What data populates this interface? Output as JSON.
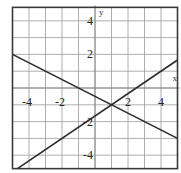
{
  "chart_data": {
    "type": "line",
    "title": "",
    "xlabel": "x",
    "ylabel": "y",
    "xlim": [
      -5,
      5
    ],
    "ylim": [
      -4.8,
      4.8
    ],
    "grid": true,
    "x_ticks": [
      -4,
      -2,
      2,
      4
    ],
    "y_ticks": [
      4,
      2,
      -2,
      -4
    ],
    "x_tick_labels": [
      "-4",
      "-2",
      "2",
      "4"
    ],
    "y_tick_labels": [
      "4",
      "2",
      "-2",
      "-4"
    ],
    "series": [
      {
        "name": "line-decreasing",
        "equation": "y = -0.5x - 0.5",
        "slope": -0.5,
        "intercept": -0.5,
        "x": [
          -5,
          5
        ],
        "y": [
          2,
          -3
        ]
      },
      {
        "name": "line-increasing",
        "equation": "y = (2/3)x - 5/3",
        "slope": 0.6667,
        "intercept": -1.6667,
        "x": [
          -4.7,
          5
        ],
        "y": [
          -4.8,
          1.667
        ]
      }
    ],
    "intersection": {
      "x": 1,
      "y": -1
    },
    "legend": null
  },
  "labels": {
    "x_axis": "x",
    "y_axis": "y",
    "xt0": "-4",
    "xt1": "-2",
    "xt2": "2",
    "xt3": "4",
    "yt0": "4",
    "yt1": "2",
    "yt2": "-2",
    "yt3": "-4"
  }
}
